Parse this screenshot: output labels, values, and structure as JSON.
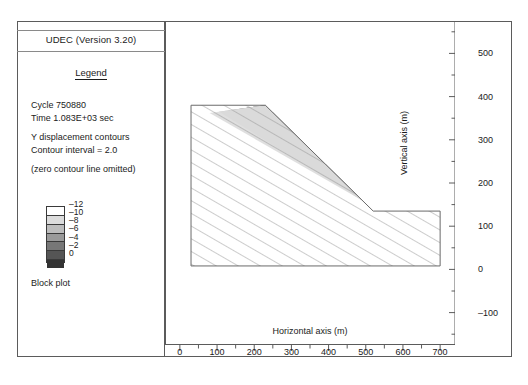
{
  "legend": {
    "title": "UDEC (Version 3.20)",
    "heading": "Legend",
    "cycle": "Cycle 750880",
    "time": "Time  1.083E+03 sec",
    "contour_label": "Y displacement contours",
    "contour_interval": "Contour interval = 2.0",
    "zero_note": "(zero contour line omitted)",
    "block_plot": "Block plot",
    "scale_labels": [
      "-12",
      "-10",
      "-8",
      "-6",
      "-4",
      "-2",
      "0"
    ],
    "scale_colors": [
      "#ffffff",
      "#dcdcdc",
      "#bdbdbd",
      "#9a9a9a",
      "#777777",
      "#555555",
      "#333333"
    ]
  },
  "axes": {
    "x_title": "Horizontal axis (m)",
    "y_title": "Vertical axis (m)",
    "x_ticks": [
      0,
      100,
      200,
      300,
      400,
      500,
      600,
      700
    ],
    "y_ticks": [
      -100,
      0,
      100,
      200,
      300,
      400,
      500
    ],
    "x_range": [
      -40,
      740
    ],
    "y_range": [
      -175,
      575
    ],
    "x_minor_step": 50,
    "y_minor_step": 50
  },
  "caption": "",
  "chart_data": {
    "type": "area",
    "title": "UDEC (Version 3.20)",
    "subtitle": "Y displacement contours",
    "xlabel": "Horizontal axis (m)",
    "ylabel": "Vertical axis (m)",
    "xlim": [
      -40,
      740
    ],
    "ylim": [
      -175,
      575
    ],
    "grid": false,
    "legend_position": "left-panel",
    "contour_interval": 2.0,
    "contour_levels": [
      -12,
      -10,
      -8,
      -6,
      -4,
      -2,
      0
    ],
    "level_colors": [
      "#ffffff",
      "#dcdcdc",
      "#bdbdbd",
      "#9a9a9a",
      "#777777",
      "#555555",
      "#333333"
    ],
    "annotations": [
      "Cycle 750880",
      "Time  1.083E+03 sec",
      "Contour interval = 2.0",
      "(zero contour line omitted)",
      "Block plot"
    ],
    "block_outline": [
      {
        "x": 30,
        "y": 380
      },
      {
        "x": 230,
        "y": 380
      },
      {
        "x": 520,
        "y": 135
      },
      {
        "x": 700,
        "y": 135
      },
      {
        "x": 700,
        "y": 8
      },
      {
        "x": 30,
        "y": 8
      }
    ],
    "slope_crest": {
      "x": 230,
      "y": 380
    },
    "slope_toe": {
      "x": 520,
      "y": 135
    },
    "bench_level": 135,
    "crest_level": 380,
    "base_level": 8,
    "contour_bands": [
      {
        "level": -12,
        "color": "#ffffff"
      },
      {
        "level": -10,
        "color": "#dcdcdc"
      },
      {
        "level": -8,
        "color": "#bdbdbd"
      },
      {
        "level": -6,
        "color": "#9a9a9a"
      },
      {
        "level": -4,
        "color": "#777777"
      },
      {
        "level": -2,
        "color": "#555555"
      },
      {
        "level": 0,
        "color": "#333333"
      }
    ],
    "jointing": {
      "pattern": "hatch",
      "angle_deg": 60,
      "spacing_m": 28
    }
  }
}
